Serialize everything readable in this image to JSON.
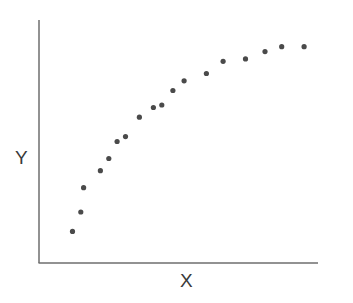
{
  "chart_data": {
    "type": "scatter",
    "title": "",
    "xlabel": "X",
    "ylabel": "Y",
    "grid": false,
    "legend": null,
    "ticks": "none",
    "xlim": [
      0,
      100
    ],
    "ylim": [
      0,
      100
    ],
    "series": [
      {
        "name": "points",
        "color": "#4a4a4a",
        "x": [
          12,
          15,
          16,
          22,
          25,
          28,
          31,
          36,
          41,
          44,
          48,
          52,
          60,
          66,
          74,
          81,
          87,
          95
        ],
        "y": [
          13,
          21,
          31,
          38,
          43,
          50,
          52,
          60,
          64,
          65,
          71,
          75,
          78,
          83,
          84,
          87,
          89,
          89
        ]
      }
    ]
  },
  "labels": {
    "x": "X",
    "y": "Y"
  },
  "style": {
    "axis_color": "#6e6e6e",
    "point_color": "#4a4a4a"
  }
}
